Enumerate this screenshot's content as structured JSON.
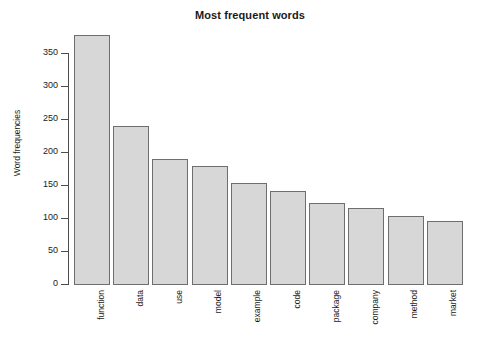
{
  "chart_data": {
    "type": "bar",
    "title": "Most frequent words",
    "xlabel": "",
    "ylabel": "Word frequencies",
    "categories": [
      "function",
      "data",
      "use",
      "model",
      "example",
      "code",
      "package",
      "company",
      "method",
      "market"
    ],
    "values": [
      379,
      241,
      191,
      180,
      154,
      142,
      125,
      117,
      104,
      97
    ],
    "ylim": [
      0,
      379
    ],
    "yticks": [
      0,
      50,
      100,
      150,
      200,
      250,
      300,
      350
    ],
    "ytick_labels": [
      "0",
      "50",
      "100",
      "150",
      "200",
      "250",
      "300",
      "350"
    ],
    "grid": false,
    "legend": null,
    "bar_fill_color": "#d7d7d7",
    "bar_border_color": "#6e6e6e",
    "axis_color": "#4d4d4d",
    "background_color": "#ffffff"
  }
}
